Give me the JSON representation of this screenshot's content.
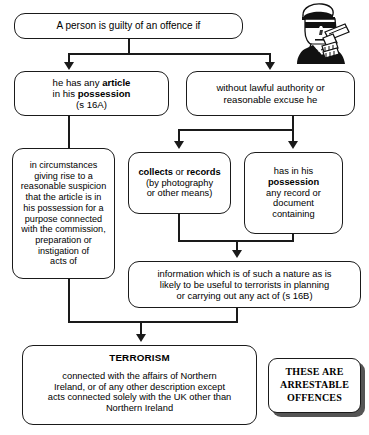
{
  "diagram": {
    "boxes": {
      "top": {
        "text": "A person is guilty of an offence if"
      },
      "left_branch": {
        "line1_a": "he has any ",
        "line1_b": "article",
        "line2_a": "in his ",
        "line2_b": "possession",
        "line3": "(s 16A)"
      },
      "right_branch": {
        "line1": "without lawful authority or",
        "line2": "reasonable excuse he"
      },
      "circumstances": {
        "line1": "in circumstances",
        "line2": "giving rise to a",
        "line3": "reasonable suspicion",
        "line4": "that the article is in",
        "line5": "his possession for a",
        "line6": "purpose connected",
        "line7": "with the commission,",
        "line8": "preparation or",
        "line9": "instigation of",
        "line10": "acts of"
      },
      "collects": {
        "line1_a": "collects",
        "line1_b": " or ",
        "line1_c": "records",
        "line2": "(by photography",
        "line3": "or other means)"
      },
      "has_record": {
        "line1": "has in his",
        "line2": "possession",
        "line3": "any record or",
        "line4": "document",
        "line5": "containing"
      },
      "information": {
        "line1": "information which is of such a nature as is",
        "line2": "likely to be useful to terrorists in planning",
        "line3": "or carrying out any act of (s 16B)"
      },
      "terrorism": {
        "title": "TERRORISM",
        "line1": "connected with the affairs of Northern",
        "line2": "Ireland, or of any other description except",
        "line3": "acts connected solely with the UK other than",
        "line4": "Northern Ireland"
      },
      "arrestable": {
        "line1": "THESE ARE",
        "line2": "ARRESTABLE",
        "line3": "OFFENCES"
      }
    },
    "illustration": {
      "label": "terrorist-figure-illustration"
    },
    "colors": {
      "stroke": "#1a1a1a",
      "background": "#ffffff",
      "shadow": "#555555"
    }
  }
}
